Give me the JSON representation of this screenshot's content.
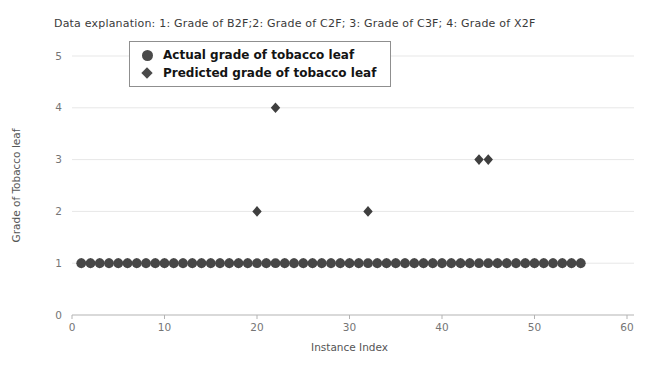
{
  "header": {
    "data_explanation": "Data explanation: 1: Grade of B2F;2: Grade of C2F; 3: Grade of C3F; 4: Grade of X2F"
  },
  "colors": {
    "actual_marker": "#474747",
    "predicted_marker": "#3f3f3f",
    "axis_line": "#b3b3b3",
    "gridline": "#e7e7e7",
    "tick_label": "#757575",
    "axis_label": "#555555"
  },
  "chart_data": {
    "type": "scatter",
    "title": "",
    "annotation": "Data explanation: 1: Grade of B2F;2: Grade of C2F; 3: Grade of C3F; 4: Grade of X2F",
    "xlabel": "Instance Index",
    "ylabel": "Grade of Tobacco leaf",
    "xlim": [
      0,
      60
    ],
    "ylim": [
      0,
      5
    ],
    "x_ticks": [
      0,
      10,
      20,
      30,
      40,
      50,
      60
    ],
    "y_ticks": [
      0,
      1,
      2,
      3,
      4,
      5
    ],
    "grid": "horizontal",
    "legend": {
      "position": "upper-left",
      "entries": [
        {
          "label": "Actual grade of tobacco leaf",
          "marker": "circle"
        },
        {
          "label": "Predicted grade of tobacco leaf",
          "marker": "diamond"
        }
      ]
    },
    "series": [
      {
        "name": "Actual grade of tobacco leaf",
        "marker": "circle",
        "color": "#474747",
        "x": [
          1,
          2,
          3,
          4,
          5,
          6,
          7,
          8,
          9,
          10,
          11,
          12,
          13,
          14,
          15,
          16,
          17,
          18,
          19,
          20,
          21,
          22,
          23,
          24,
          25,
          26,
          27,
          28,
          29,
          30,
          31,
          32,
          33,
          34,
          35,
          36,
          37,
          38,
          39,
          40,
          41,
          42,
          43,
          44,
          45,
          46,
          47,
          48,
          49,
          50,
          51,
          52,
          53,
          54,
          55
        ],
        "y": [
          1,
          1,
          1,
          1,
          1,
          1,
          1,
          1,
          1,
          1,
          1,
          1,
          1,
          1,
          1,
          1,
          1,
          1,
          1,
          1,
          1,
          1,
          1,
          1,
          1,
          1,
          1,
          1,
          1,
          1,
          1,
          1,
          1,
          1,
          1,
          1,
          1,
          1,
          1,
          1,
          1,
          1,
          1,
          1,
          1,
          1,
          1,
          1,
          1,
          1,
          1,
          1,
          1,
          1,
          1
        ]
      },
      {
        "name": "Predicted grade of tobacco leaf",
        "marker": "diamond",
        "color": "#3f3f3f",
        "x": [
          1,
          2,
          3,
          4,
          5,
          6,
          7,
          8,
          9,
          10,
          11,
          12,
          13,
          14,
          15,
          16,
          17,
          18,
          19,
          20,
          21,
          22,
          23,
          24,
          25,
          26,
          27,
          28,
          29,
          30,
          31,
          32,
          33,
          34,
          35,
          36,
          37,
          38,
          39,
          40,
          41,
          42,
          43,
          44,
          45,
          46,
          47,
          48,
          49,
          50,
          51,
          52,
          53,
          54,
          55
        ],
        "y": [
          1,
          1,
          1,
          1,
          1,
          1,
          1,
          1,
          1,
          1,
          1,
          1,
          1,
          1,
          1,
          1,
          1,
          1,
          1,
          2,
          1,
          4,
          1,
          1,
          1,
          1,
          1,
          1,
          1,
          1,
          1,
          2,
          1,
          1,
          1,
          1,
          1,
          1,
          1,
          1,
          1,
          1,
          1,
          3,
          3,
          1,
          1,
          1,
          1,
          1,
          1,
          1,
          1,
          1,
          1
        ]
      }
    ],
    "mismatched_predictions": [
      {
        "instance": 20,
        "predicted": 2
      },
      {
        "instance": 22,
        "predicted": 4
      },
      {
        "instance": 32,
        "predicted": 2
      },
      {
        "instance": 44,
        "predicted": 3
      },
      {
        "instance": 45,
        "predicted": 3
      }
    ]
  }
}
